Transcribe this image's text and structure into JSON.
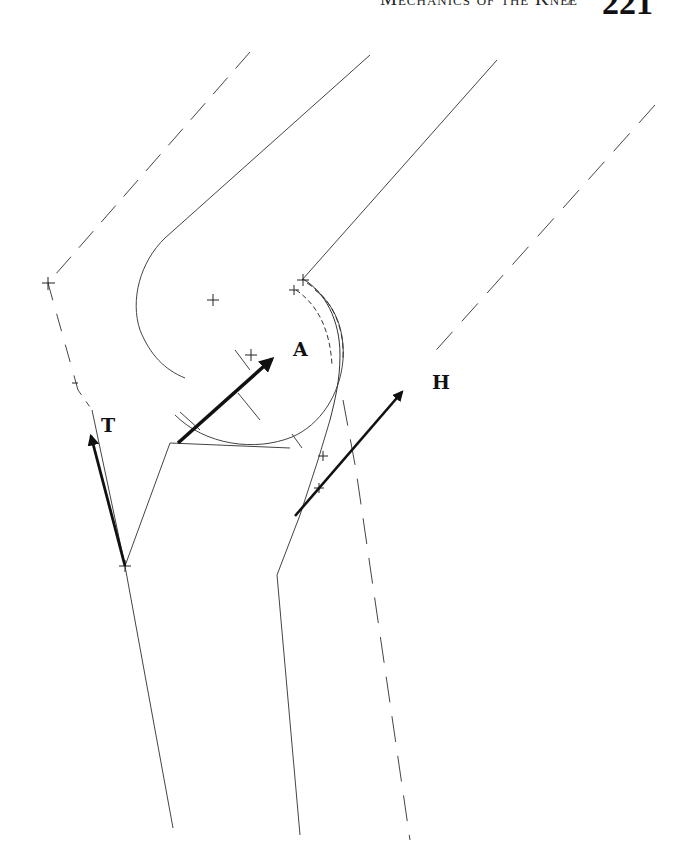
{
  "header": {
    "running_head": "Mechanics of the Knee",
    "separator": "/",
    "page_number": "221"
  },
  "diagram": {
    "labels": {
      "A": "A",
      "T": "T",
      "H": "H"
    },
    "vectors": [
      {
        "name": "A",
        "description": "joint reaction force arrow"
      },
      {
        "name": "T",
        "description": "patellar tendon force arrow"
      },
      {
        "name": "H",
        "description": "hamstring force arrow"
      }
    ],
    "colors": {
      "line": "#333333",
      "arrow": "#111111",
      "background": "#ffffff"
    }
  }
}
